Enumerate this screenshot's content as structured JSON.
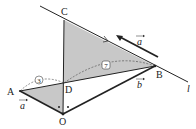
{
  "diagram": {
    "points": {
      "A": {
        "label": "A",
        "x": 20,
        "y": 91
      },
      "B": {
        "label": "B",
        "x": 155,
        "y": 66
      },
      "C": {
        "label": "C",
        "x": 64,
        "y": 20
      },
      "D": {
        "label": "D",
        "x": 64,
        "y": 83
      },
      "O": {
        "label": "O",
        "x": 63,
        "y": 114
      }
    },
    "line_label": "l",
    "vectors": {
      "a_bottom": "a",
      "a_top": "a",
      "b": "b"
    },
    "ratio_labels": {
      "AD": "3",
      "DB": "7"
    },
    "colors": {
      "shade": "#c8c8c8",
      "stroke": "#222222"
    }
  }
}
